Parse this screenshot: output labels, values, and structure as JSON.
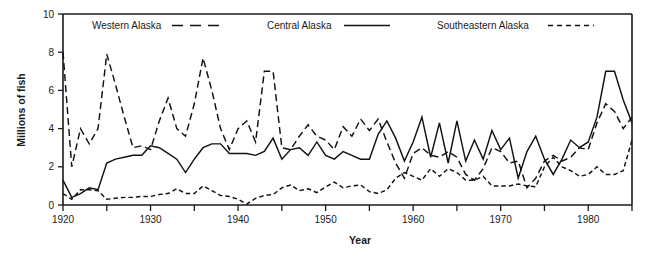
{
  "chart_data": {
    "type": "line",
    "title": "",
    "xlabel": "Year",
    "ylabel": "Millions of fish",
    "xlim": [
      1920,
      1985
    ],
    "ylim": [
      0,
      10
    ],
    "xticks_major": [
      1920,
      1930,
      1940,
      1950,
      1960,
      1970,
      1980
    ],
    "xticks_minor": [
      1925,
      1935,
      1945,
      1955,
      1965,
      1975,
      1985
    ],
    "yticks": [
      0,
      2,
      4,
      6,
      8,
      10
    ],
    "grid": false,
    "legend_position": "top-inside",
    "x": [
      1920,
      1921,
      1922,
      1923,
      1924,
      1925,
      1926,
      1927,
      1928,
      1929,
      1930,
      1931,
      1932,
      1933,
      1934,
      1935,
      1936,
      1937,
      1938,
      1939,
      1940,
      1941,
      1942,
      1943,
      1944,
      1945,
      1946,
      1947,
      1948,
      1949,
      1950,
      1951,
      1952,
      1953,
      1954,
      1955,
      1956,
      1957,
      1958,
      1959,
      1960,
      1961,
      1962,
      1963,
      1964,
      1965,
      1966,
      1967,
      1968,
      1969,
      1970,
      1971,
      1972,
      1973,
      1974,
      1975,
      1976,
      1977,
      1978,
      1979,
      1980,
      1981,
      1982,
      1983,
      1984,
      1985
    ],
    "series": [
      {
        "name": "Western Alaska",
        "line_style": "long-dash",
        "dasharray": "7,4",
        "values": [
          8.0,
          2.0,
          4.0,
          3.2,
          4.0,
          7.9,
          6.3,
          4.6,
          3.0,
          3.1,
          2.9,
          4.4,
          5.6,
          4.0,
          3.6,
          5.3,
          7.7,
          6.0,
          4.0,
          2.9,
          4.0,
          4.4,
          3.3,
          7.0,
          7.0,
          3.0,
          2.9,
          3.6,
          4.2,
          3.6,
          3.4,
          2.9,
          4.1,
          3.6,
          4.5,
          3.9,
          4.5,
          3.3,
          2.2,
          1.4,
          2.7,
          3.0,
          2.6,
          2.5,
          2.8,
          2.5,
          1.6,
          1.3,
          1.9,
          3.0,
          2.8,
          2.2,
          2.3,
          0.9,
          1.4,
          2.3,
          2.6,
          2.3,
          2.5,
          3.0,
          2.9,
          4.3,
          5.3,
          4.9,
          4.0,
          4.6
        ]
      },
      {
        "name": "Central Alaska",
        "line_style": "solid",
        "dasharray": "none",
        "values": [
          1.3,
          0.4,
          0.6,
          0.9,
          0.8,
          2.2,
          2.4,
          2.5,
          2.6,
          2.6,
          3.1,
          3.0,
          2.7,
          2.4,
          1.7,
          2.4,
          3.0,
          3.2,
          3.2,
          2.7,
          2.7,
          2.7,
          2.6,
          2.8,
          3.5,
          2.4,
          2.9,
          3.0,
          2.6,
          3.3,
          2.6,
          2.4,
          2.8,
          2.6,
          2.4,
          2.4,
          3.7,
          4.4,
          3.5,
          2.3,
          3.3,
          4.6,
          2.5,
          4.3,
          2.2,
          4.4,
          2.3,
          3.4,
          2.4,
          3.9,
          2.9,
          3.5,
          1.4,
          2.8,
          3.6,
          2.4,
          1.6,
          2.4,
          3.4,
          3.0,
          3.3,
          4.6,
          7.0,
          7.0,
          5.5,
          4.3
        ]
      },
      {
        "name": "Southeastern Alaska",
        "line_style": "short-dash",
        "dasharray": "4.5,3",
        "values": [
          0.6,
          0.3,
          0.8,
          0.8,
          0.75,
          0.3,
          0.35,
          0.4,
          0.4,
          0.45,
          0.45,
          0.55,
          0.6,
          0.85,
          0.6,
          0.6,
          1.0,
          0.75,
          0.5,
          0.45,
          0.3,
          0.05,
          0.35,
          0.5,
          0.55,
          0.9,
          1.05,
          0.75,
          0.85,
          0.65,
          0.95,
          1.2,
          0.9,
          1.0,
          1.05,
          0.7,
          0.6,
          0.8,
          1.4,
          1.7,
          1.5,
          1.3,
          1.9,
          1.5,
          1.9,
          1.7,
          1.3,
          1.3,
          1.5,
          1.0,
          1.0,
          1.0,
          1.1,
          1.0,
          0.95,
          2.0,
          2.5,
          2.0,
          1.8,
          1.5,
          1.6,
          2.0,
          1.6,
          1.6,
          1.8,
          3.4
        ]
      }
    ]
  },
  "legend": {
    "items": [
      {
        "label": "Western Alaska",
        "style": "long-dash"
      },
      {
        "label": "Central Alaska",
        "style": "solid"
      },
      {
        "label": "Southeastern Alaska",
        "style": "short-dash"
      }
    ]
  },
  "axes": {
    "y_title": "Millions of fish",
    "x_title": "Year",
    "y_tick_labels": [
      "0",
      "2",
      "4",
      "6",
      "8",
      "10"
    ],
    "x_tick_labels": [
      "1920",
      "1930",
      "1940",
      "1950",
      "1960",
      "1970",
      "1980"
    ]
  }
}
